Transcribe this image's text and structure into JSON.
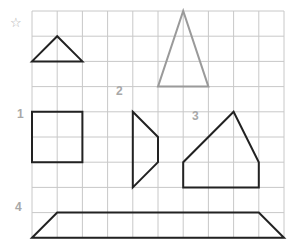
{
  "grid": {
    "origin_x": 32,
    "origin_y": 11,
    "cell": 25.2,
    "cols": 10,
    "rows": 9,
    "line_color": "#c8c8c8"
  },
  "marker": {
    "icon": "star-outline-icon",
    "glyph": "☆"
  },
  "labels": [
    {
      "text": "1",
      "x": 17,
      "y": 115
    },
    {
      "text": "2",
      "x": 116,
      "y": 92
    },
    {
      "text": "3",
      "x": 192,
      "y": 117
    },
    {
      "text": "4",
      "x": 15,
      "y": 208
    }
  ],
  "shapes": [
    {
      "name": "example-triangle",
      "color": "#222222",
      "points": [
        [
          0,
          2
        ],
        [
          1,
          1
        ],
        [
          2,
          2
        ]
      ]
    },
    {
      "name": "gray-triangle",
      "color": "#9a9a9a",
      "points": [
        [
          5,
          3
        ],
        [
          6,
          0
        ],
        [
          7,
          3
        ]
      ]
    },
    {
      "name": "shape-1-square",
      "color": "#222222",
      "points": [
        [
          0,
          4
        ],
        [
          2,
          4
        ],
        [
          2,
          6
        ],
        [
          0,
          6
        ]
      ]
    },
    {
      "name": "shape-2-quadrilateral",
      "color": "#222222",
      "points": [
        [
          4,
          4
        ],
        [
          5,
          5
        ],
        [
          5,
          6
        ],
        [
          4,
          7
        ]
      ]
    },
    {
      "name": "shape-3-pentagon",
      "color": "#222222",
      "points": [
        [
          6,
          7
        ],
        [
          6,
          6
        ],
        [
          8,
          4
        ],
        [
          9,
          6
        ],
        [
          9,
          7
        ]
      ]
    },
    {
      "name": "shape-4-trapezoid",
      "color": "#222222",
      "points": [
        [
          0,
          9
        ],
        [
          1,
          8
        ],
        [
          9,
          8
        ],
        [
          10,
          9
        ]
      ]
    }
  ]
}
